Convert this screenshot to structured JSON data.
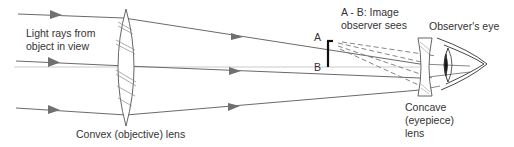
{
  "diagram": {
    "labels": {
      "light_rays_line1": "Light rays from",
      "light_rays_line2": "object in view",
      "objective_lens": "Convex (objective) lens",
      "image_line1": "A - B: Image",
      "image_line2": "observer sees",
      "point_a": "A",
      "point_b": "B",
      "observer_eye": "Observer's eye",
      "eyepiece_line1": "Concave",
      "eyepiece_line2": "(eyepiece)",
      "eyepiece_line3": "lens"
    },
    "colors": {
      "ray": "#6a6a6a",
      "lens_outline": "#555555",
      "image_bar": "#111111",
      "text": "#333333"
    }
  }
}
